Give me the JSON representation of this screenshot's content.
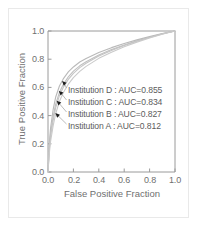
{
  "figure": {
    "background_color": "#ffffff",
    "border_color": "#e9e9e9",
    "axis_color": "#9a9a9a",
    "text_color": "#6f6f6f"
  },
  "chart_data": {
    "type": "line",
    "title": "",
    "xlabel": "False Positive Fraction",
    "ylabel": "True Positive Fraction",
    "xlim": [
      0.0,
      1.0
    ],
    "ylim": [
      0.0,
      1.0
    ],
    "grid": false,
    "legend_position": "inside-annotations",
    "xticks": [
      "0.0",
      "0.2",
      "0.4",
      "0.6",
      "0.8",
      "1.0"
    ],
    "yticks": [
      "0.0",
      "0.2",
      "0.4",
      "0.6",
      "0.8",
      "1.0"
    ],
    "xtick_values": [
      0.0,
      0.2,
      0.4,
      0.6,
      0.8,
      1.0
    ],
    "ytick_values": [
      0.0,
      0.2,
      0.4,
      0.6,
      0.8,
      1.0
    ],
    "series": [
      {
        "name": "Institution D",
        "auc": 0.855,
        "color": "#b9b9b9",
        "annotation": "Institution D : AUC=0.855",
        "x": [
          0.0,
          0.01,
          0.02,
          0.04,
          0.06,
          0.09,
          0.12,
          0.16,
          0.2,
          0.25,
          0.3,
          0.4,
          0.5,
          0.6,
          0.7,
          0.8,
          0.9,
          0.95,
          1.0
        ],
        "y": [
          0.0,
          0.2,
          0.31,
          0.44,
          0.53,
          0.61,
          0.66,
          0.71,
          0.745,
          0.78,
          0.805,
          0.848,
          0.882,
          0.911,
          0.937,
          0.96,
          0.982,
          0.991,
          1.0
        ]
      },
      {
        "name": "Institution C",
        "auc": 0.834,
        "color": "#bfbfbf",
        "annotation": "Institution C : AUC=0.834",
        "x": [
          0.0,
          0.01,
          0.02,
          0.04,
          0.06,
          0.09,
          0.12,
          0.16,
          0.2,
          0.25,
          0.3,
          0.4,
          0.5,
          0.6,
          0.7,
          0.8,
          0.9,
          0.95,
          1.0
        ],
        "y": [
          0.0,
          0.17,
          0.27,
          0.39,
          0.48,
          0.565,
          0.62,
          0.675,
          0.715,
          0.753,
          0.782,
          0.83,
          0.868,
          0.901,
          0.93,
          0.956,
          0.98,
          0.99,
          1.0
        ]
      },
      {
        "name": "Institution B",
        "auc": 0.827,
        "color": "#c4c4c4",
        "annotation": "Institution B : AUC=0.827",
        "x": [
          0.0,
          0.01,
          0.02,
          0.04,
          0.06,
          0.09,
          0.12,
          0.16,
          0.2,
          0.25,
          0.3,
          0.4,
          0.5,
          0.6,
          0.7,
          0.8,
          0.9,
          0.95,
          1.0
        ],
        "y": [
          0.0,
          0.155,
          0.25,
          0.365,
          0.455,
          0.542,
          0.6,
          0.657,
          0.699,
          0.74,
          0.771,
          0.822,
          0.862,
          0.897,
          0.927,
          0.954,
          0.979,
          0.99,
          1.0
        ]
      },
      {
        "name": "Institution A",
        "auc": 0.812,
        "color": "#cacaca",
        "annotation": "Institution A : AUC=0.812",
        "x": [
          0.0,
          0.01,
          0.02,
          0.04,
          0.06,
          0.09,
          0.12,
          0.16,
          0.2,
          0.25,
          0.3,
          0.4,
          0.5,
          0.6,
          0.7,
          0.8,
          0.9,
          0.95,
          1.0
        ],
        "y": [
          0.0,
          0.13,
          0.215,
          0.325,
          0.412,
          0.5,
          0.562,
          0.623,
          0.669,
          0.714,
          0.749,
          0.806,
          0.85,
          0.888,
          0.921,
          0.95,
          0.977,
          0.989,
          1.0
        ]
      }
    ],
    "annotations": [
      {
        "text": "Institution D : AUC=0.855",
        "anchor_x": 0.11,
        "anchor_y": 0.645
      },
      {
        "text": "Institution C : AUC=0.834",
        "anchor_x": 0.085,
        "anchor_y": 0.575
      },
      {
        "text": "Institution B : AUC=0.827",
        "anchor_x": 0.068,
        "anchor_y": 0.505
      },
      {
        "text": "Institution A : AUC=0.812",
        "anchor_x": 0.058,
        "anchor_y": 0.418
      }
    ]
  }
}
